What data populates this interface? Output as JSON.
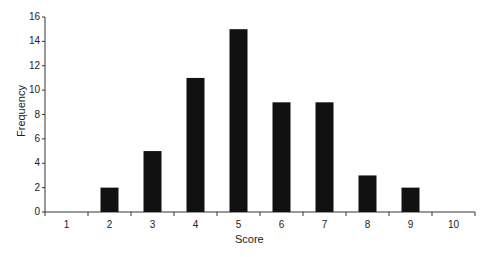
{
  "chart_data": {
    "type": "bar",
    "title": "",
    "xlabel": "Score",
    "ylabel": "Frequency",
    "categories": [
      "1",
      "2",
      "3",
      "4",
      "5",
      "6",
      "7",
      "8",
      "9",
      "10"
    ],
    "values": [
      0,
      2,
      5,
      11,
      15,
      9,
      9,
      3,
      2,
      0
    ],
    "ylim": [
      0,
      16
    ],
    "yticks": [
      "0",
      "2",
      "4",
      "6",
      "8",
      "10",
      "12",
      "14",
      "16"
    ],
    "grid": false,
    "bar_color": "#111111"
  }
}
